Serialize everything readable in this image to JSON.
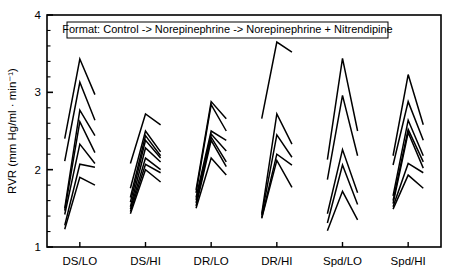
{
  "figure": {
    "background": "#ffffff",
    "line_color": "#000000",
    "axis_color": "#000000"
  },
  "axes": {
    "ylabel": "RVR (mm Hg/ml · min⁻¹)",
    "ylabel_plain": "RVR (mm Hg/ml - min -1)",
    "y_ticks": [
      "1",
      "2",
      "3",
      "4"
    ],
    "y_tick_values": [
      1,
      2,
      3,
      4
    ],
    "y_minor_step": 0.2,
    "ylim": [
      1,
      4
    ],
    "xlabel": "",
    "x_tick_labels": [
      "DS/LO",
      "DS/HI",
      "DR/LO",
      "DR/HI",
      "Spd/LO",
      "Spd/HI"
    ],
    "grid": "off",
    "frame": "box"
  },
  "legend": {
    "position": "top-center-inside",
    "boxed": true,
    "text": "Format: Control -> Norepinephrine -> Norepinephrine + Nitrendipine"
  },
  "chart_data": {
    "type": "line",
    "title": "",
    "subtitle": "",
    "xlabel": "",
    "ylabel": "RVR (mm Hg/ml · min⁻¹)",
    "ylim": [
      1,
      4
    ],
    "grid": false,
    "legend_position": "top-center-inside",
    "annotations": [
      "Format: Control -> Norepinephrine -> Norepinephrine + Nitrendipine"
    ],
    "x_points": [
      "Control",
      "Norepinephrine",
      "Norepinephrine + Nitrendipine"
    ],
    "categories": [
      "DS/LO",
      "DS/HI",
      "DR/LO",
      "DR/HI",
      "Spd/LO",
      "Spd/HI"
    ],
    "groups": [
      {
        "name": "DS/LO",
        "series": [
          {
            "name": "DS/LO-1",
            "values": [
              2.4,
              3.43,
              2.97
            ]
          },
          {
            "name": "DS/LO-2",
            "values": [
              2.11,
              3.13,
              2.64
            ]
          },
          {
            "name": "DS/LO-3",
            "values": [
              1.5,
              2.77,
              2.44
            ]
          },
          {
            "name": "DS/LO-4",
            "values": [
              1.47,
              2.62,
              2.22
            ]
          },
          {
            "name": "DS/LO-5",
            "values": [
              1.42,
              2.33,
              2.08
            ]
          },
          {
            "name": "DS/LO-6",
            "values": [
              1.28,
              2.07,
              2.03
            ]
          },
          {
            "name": "DS/LO-7",
            "values": [
              1.23,
              1.9,
              1.8
            ]
          }
        ]
      },
      {
        "name": "DS/HI",
        "series": [
          {
            "name": "DS/HI-1",
            "values": [
              2.08,
              2.72,
              2.58
            ]
          },
          {
            "name": "DS/HI-2",
            "values": [
              1.76,
              2.5,
              2.23
            ]
          },
          {
            "name": "DS/HI-3",
            "values": [
              1.64,
              2.44,
              2.18
            ]
          },
          {
            "name": "DS/HI-4",
            "values": [
              1.58,
              2.38,
              2.15
            ]
          },
          {
            "name": "DS/HI-5",
            "values": [
              1.52,
              2.28,
              2.1
            ]
          },
          {
            "name": "DS/HI-6",
            "values": [
              1.49,
              2.15,
              2.0
            ]
          },
          {
            "name": "DS/HI-7",
            "values": [
              1.46,
              2.07,
              1.96
            ]
          },
          {
            "name": "DS/HI-8",
            "values": [
              1.43,
              2.0,
              1.84
            ]
          }
        ]
      },
      {
        "name": "DR/LO",
        "series": [
          {
            "name": "DR/LO-1",
            "values": [
              1.74,
              2.88,
              2.66
            ]
          },
          {
            "name": "DR/LO-2",
            "values": [
              1.7,
              2.84,
              2.5
            ]
          },
          {
            "name": "DR/LO-3",
            "values": [
              1.64,
              2.5,
              2.38
            ]
          },
          {
            "name": "DR/LO-4",
            "values": [
              1.61,
              2.46,
              2.24
            ]
          },
          {
            "name": "DR/LO-5",
            "values": [
              1.57,
              2.42,
              2.1
            ]
          },
          {
            "name": "DR/LO-6",
            "values": [
              1.53,
              2.38,
              2.04
            ]
          },
          {
            "name": "DR/LO-7",
            "values": [
              1.5,
              2.15,
              1.93
            ]
          }
        ]
      },
      {
        "name": "DR/HI",
        "series": [
          {
            "name": "DR/HI-1",
            "values": [
              2.66,
              3.65,
              3.52
            ]
          },
          {
            "name": "DR/HI-2",
            "values": [
              1.43,
              2.72,
              2.33
            ]
          },
          {
            "name": "DR/HI-3",
            "values": [
              1.41,
              2.45,
              2.16
            ]
          },
          {
            "name": "DR/HI-4",
            "values": [
              1.38,
              2.2,
              2.06
            ]
          },
          {
            "name": "DR/HI-5",
            "values": [
              1.37,
              2.12,
              1.77
            ]
          }
        ]
      },
      {
        "name": "Spd/LO",
        "series": [
          {
            "name": "Spd/LO-1",
            "values": [
              2.13,
              3.44,
              2.5
            ]
          },
          {
            "name": "Spd/LO-2",
            "values": [
              1.87,
              2.96,
              2.18
            ]
          },
          {
            "name": "Spd/LO-3",
            "values": [
              1.43,
              2.26,
              1.7
            ]
          },
          {
            "name": "Spd/LO-4",
            "values": [
              1.31,
              2.06,
              1.55
            ]
          },
          {
            "name": "Spd/LO-5",
            "values": [
              1.21,
              1.72,
              1.35
            ]
          }
        ]
      },
      {
        "name": "Spd/HI",
        "series": [
          {
            "name": "Spd/HI-1",
            "values": [
              2.18,
              3.23,
              2.58
            ]
          },
          {
            "name": "Spd/HI-2",
            "values": [
              2.06,
              2.88,
              2.38
            ]
          },
          {
            "name": "Spd/HI-3",
            "values": [
              1.66,
              2.64,
              2.18
            ]
          },
          {
            "name": "Spd/HI-4",
            "values": [
              1.6,
              2.52,
              2.1
            ]
          },
          {
            "name": "Spd/HI-5",
            "values": [
              1.56,
              2.48,
              2.02
            ]
          },
          {
            "name": "Spd/HI-6",
            "values": [
              1.52,
              2.08,
              1.96
            ]
          },
          {
            "name": "Spd/HI-7",
            "values": [
              1.49,
              1.93,
              1.76
            ]
          }
        ]
      }
    ]
  },
  "layout": {
    "plot_left": 47,
    "plot_right": 441,
    "plot_top": 15,
    "plot_bottom": 247,
    "group_span": 0.46,
    "legend_box": {
      "x": 67,
      "y": 22,
      "w": 321,
      "h": 16
    }
  }
}
